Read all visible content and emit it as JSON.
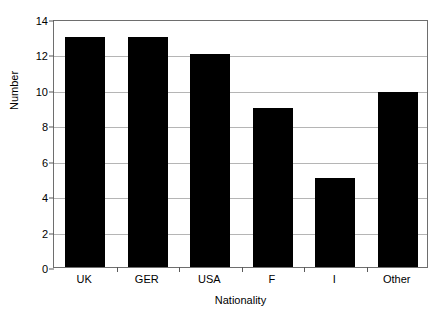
{
  "chart_data": {
    "type": "bar",
    "title": "",
    "xlabel": "Nationality",
    "ylabel": "Number",
    "categories": [
      "UK",
      "GER",
      "USA",
      "F",
      "I",
      "Other"
    ],
    "values": [
      13,
      13,
      12,
      9,
      5,
      9.9
    ],
    "ylim": [
      0,
      14
    ],
    "ytick_values": [
      0,
      2,
      4,
      6,
      8,
      10,
      12,
      14
    ],
    "ytick_labels": [
      "0",
      "2",
      "4",
      "6",
      "8",
      "10",
      "12",
      "14"
    ],
    "grid": true,
    "legend": "none",
    "bar_color": "#000000",
    "gridline_color": "#b5b5b5",
    "frame_color": "#6e6e6e",
    "background_color": "#ffffff"
  }
}
